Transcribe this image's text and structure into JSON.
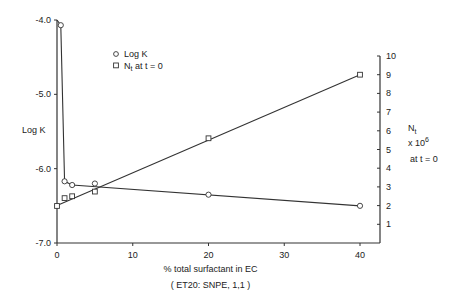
{
  "chart_data": {
    "type": "line",
    "title": "",
    "xlabel": "% total surfactant in EC",
    "xlabel_sub": "( ET20: SNPE, 1,1 )",
    "ylabel_left": "Log K",
    "ylabel_right": [
      "N",
      "t",
      "x 10",
      "6",
      "at t = 0"
    ],
    "xlim": [
      0,
      40
    ],
    "ylim_left": [
      -7.0,
      -4.0
    ],
    "ylim_right": [
      0,
      10
    ],
    "x_ticks": [
      "0",
      "10",
      "20",
      "30",
      "40"
    ],
    "y_ticks_left": [
      "-4.0",
      "-5.0",
      "-6.0",
      "-7.0"
    ],
    "y_ticks_right": [
      "1",
      "2",
      "3",
      "4",
      "5",
      "6",
      "7",
      "8",
      "9",
      "10"
    ],
    "legend": [
      {
        "marker": "circle",
        "label": "Log K"
      },
      {
        "marker": "square",
        "label": "N",
        "sub": "t",
        "suffix": " at t = 0"
      }
    ],
    "series": [
      {
        "name": "Log K",
        "axis": "left",
        "marker": "circle",
        "points": [
          [
            0.5,
            -4.07
          ],
          [
            1,
            -6.17
          ],
          [
            2,
            -6.22
          ],
          [
            5,
            -6.2
          ],
          [
            20,
            -6.35
          ],
          [
            40,
            -6.5
          ]
        ],
        "line": [
          [
            0,
            -4.0
          ],
          [
            0.5,
            -4.07
          ],
          [
            1,
            -6.17
          ],
          [
            2,
            -6.22
          ],
          [
            40,
            -6.5
          ]
        ]
      },
      {
        "name": "Nt at t = 0",
        "axis": "right",
        "marker": "square",
        "points": [
          [
            0,
            1.98
          ],
          [
            1,
            2.4
          ],
          [
            2,
            2.5
          ],
          [
            5,
            2.75
          ],
          [
            20,
            5.6
          ],
          [
            40,
            9.0
          ]
        ],
        "line": [
          [
            0,
            2.0
          ],
          [
            40,
            9.0
          ]
        ]
      }
    ]
  }
}
